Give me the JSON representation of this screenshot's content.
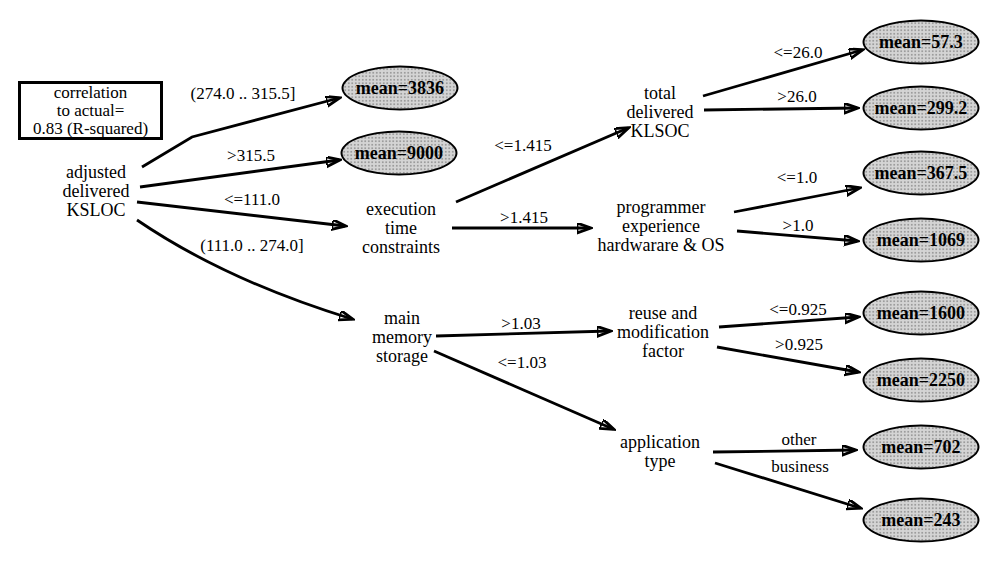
{
  "annotation": {
    "text": "correlation\nto actual=\n0.83 (R-squared)"
  },
  "nodes": [
    {
      "id": "adjusted-delivered-ksloc",
      "label": "adjusted\ndelivered\nKSLOC"
    },
    {
      "id": "execution-time-constraints",
      "label": "execution\ntime\nconstraints"
    },
    {
      "id": "main-memory-storage",
      "label": "main\nmemory\nstorage"
    },
    {
      "id": "total-delivered-klsoc",
      "label": "total\ndelivered\nKLSOC"
    },
    {
      "id": "programmer-experience-hardware-os",
      "label": "programmer\nexperience\nhardwarare & OS"
    },
    {
      "id": "reuse-and-modification-factor",
      "label": "reuse and\nmodification\nfactor"
    },
    {
      "id": "application-type",
      "label": "application\ntype"
    }
  ],
  "leaves": [
    {
      "id": "mean-3836",
      "label": "mean=3836"
    },
    {
      "id": "mean-9000",
      "label": "mean=9000"
    },
    {
      "id": "mean-57-3",
      "label": "mean=57.3"
    },
    {
      "id": "mean-299-2",
      "label": "mean=299.2"
    },
    {
      "id": "mean-367-5",
      "label": "mean=367.5"
    },
    {
      "id": "mean-1069",
      "label": "mean=1069"
    },
    {
      "id": "mean-1600",
      "label": "mean=1600"
    },
    {
      "id": "mean-2250",
      "label": "mean=2250"
    },
    {
      "id": "mean-702",
      "label": "mean=702"
    },
    {
      "id": "mean-243",
      "label": "mean=243"
    }
  ],
  "edges": [
    {
      "from": "adjusted-delivered-ksloc",
      "to": "mean-3836",
      "label": "(274.0 .. 315.5]"
    },
    {
      "from": "adjusted-delivered-ksloc",
      "to": "mean-9000",
      "label": ">315.5"
    },
    {
      "from": "adjusted-delivered-ksloc",
      "to": "execution-time-constraints",
      "label": "<=111.0"
    },
    {
      "from": "adjusted-delivered-ksloc",
      "to": "main-memory-storage",
      "label": "(111.0 .. 274.0]"
    },
    {
      "from": "execution-time-constraints",
      "to": "total-delivered-klsoc",
      "label": "<=1.415"
    },
    {
      "from": "execution-time-constraints",
      "to": "programmer-experience-hardware-os",
      "label": ">1.415"
    },
    {
      "from": "total-delivered-klsoc",
      "to": "mean-57-3",
      "label": "<=26.0"
    },
    {
      "from": "total-delivered-klsoc",
      "to": "mean-299-2",
      "label": ">26.0"
    },
    {
      "from": "programmer-experience-hardware-os",
      "to": "mean-367-5",
      "label": "<=1.0"
    },
    {
      "from": "programmer-experience-hardware-os",
      "to": "mean-1069",
      "label": ">1.0"
    },
    {
      "from": "main-memory-storage",
      "to": "reuse-and-modification-factor",
      "label": ">1.03"
    },
    {
      "from": "main-memory-storage",
      "to": "application-type",
      "label": "<=1.03"
    },
    {
      "from": "reuse-and-modification-factor",
      "to": "mean-1600",
      "label": "<=0.925"
    },
    {
      "from": "reuse-and-modification-factor",
      "to": "mean-2250",
      "label": ">0.925"
    },
    {
      "from": "application-type",
      "to": "mean-702",
      "label": "other"
    },
    {
      "from": "application-type",
      "to": "mean-243",
      "label": "business"
    }
  ],
  "colors": {
    "line": "#000000",
    "text": "#000000",
    "leaf_fill": "#d4d4d4",
    "leaf_dot": "#9c9c9c",
    "background": "#ffffff"
  }
}
